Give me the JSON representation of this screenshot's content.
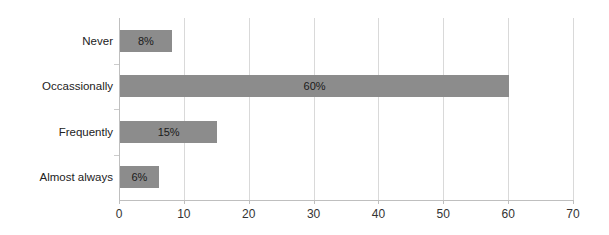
{
  "chart_data": {
    "type": "bar",
    "orientation": "horizontal",
    "title": "",
    "xlabel": "",
    "ylabel": "",
    "categories": [
      "Never",
      "Occassionally",
      "Frequently",
      "Almost always"
    ],
    "values": [
      8,
      60,
      15,
      6
    ],
    "data_labels": [
      "8%",
      "60%",
      "15%",
      "6%"
    ],
    "xlim": [
      0,
      70
    ],
    "xticks": [
      0,
      10,
      20,
      30,
      40,
      50,
      60,
      70
    ],
    "xtick_labels": [
      "0",
      "10",
      "20",
      "30",
      "40",
      "50",
      "60",
      "70"
    ],
    "grid": "vertical",
    "legend": "none",
    "bar_color": "#8c8c8c",
    "gridline_color": "#d9d9d9",
    "axis_color": "#bfbfbf",
    "background_color": "#ffffff",
    "text_color": "#222222"
  }
}
